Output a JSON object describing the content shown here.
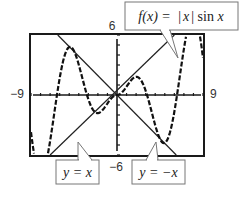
{
  "chart_data": {
    "type": "line",
    "title": "",
    "xlabel": "",
    "ylabel": "",
    "xlim": [
      -9,
      9
    ],
    "ylim": [
      -6,
      6
    ],
    "grid": false,
    "axis_tick_step": 1,
    "tick_labels": {
      "xmin": "−9",
      "xmax": "9",
      "ymin": "−6",
      "ymax": "6"
    },
    "series": [
      {
        "name": "f(x) = |x| sin x",
        "style": "dashed-stepped",
        "function": "abs(x)*sin(x)"
      },
      {
        "name": "y = x",
        "style": "solid",
        "function": "x"
      },
      {
        "name": "y = −x",
        "style": "solid",
        "function": "-x"
      }
    ],
    "annotations": [
      {
        "text_parts": [
          "f(x) = ",
          "|",
          "x",
          "|",
          " sin ",
          "x"
        ],
        "label": "f(x) = |x| sin x",
        "points_to": "f(x)",
        "position": "top-right"
      },
      {
        "label": "y = x",
        "points_to": "y = x",
        "position": "bottom-left"
      },
      {
        "label": "y = −x",
        "points_to": "y = −x",
        "position": "bottom-right"
      }
    ]
  },
  "labels": {
    "fx": "f(x) = |x| sin x",
    "yx": "y = x",
    "ynx": "y = −x"
  }
}
